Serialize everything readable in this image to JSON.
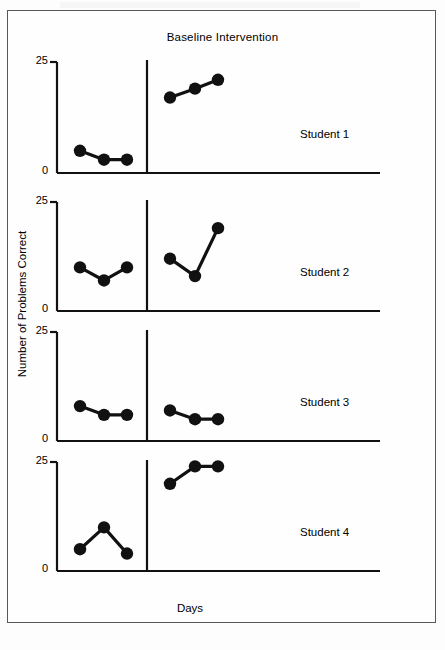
{
  "figure": {
    "phase_title": "Baseline Intervention",
    "x_axis_label": "Days",
    "y_axis_label": "Number of Problems Correct"
  },
  "chart_data": {
    "type": "line",
    "title": "Baseline Intervention",
    "xlabel": "Days",
    "ylabel": "Number of Problems Correct",
    "ylim": [
      0,
      25
    ],
    "yticks": [
      0,
      25
    ],
    "ytick_labels": [
      "0",
      "25"
    ],
    "grid": false,
    "legend": "none",
    "layout": "multiple-baseline across subjects, 4 stacked panels",
    "phases": [
      "Baseline",
      "Intervention"
    ],
    "panels": [
      {
        "name": "Student 1",
        "label": "Student 1",
        "tick_top": "25",
        "tick_bottom": "0",
        "series": [
          {
            "name": "Baseline",
            "x": [
              1,
              2,
              3
            ],
            "values": [
              5,
              3,
              3
            ]
          },
          {
            "name": "Intervention",
            "x": [
              5,
              6,
              7
            ],
            "values": [
              17,
              19,
              21
            ]
          }
        ]
      },
      {
        "name": "Student 2",
        "label": "Student 2",
        "tick_top": "25",
        "tick_bottom": "0",
        "series": [
          {
            "name": "Baseline",
            "x": [
              1,
              2,
              3
            ],
            "values": [
              10,
              7,
              10
            ]
          },
          {
            "name": "Intervention",
            "x": [
              5,
              6,
              7
            ],
            "values": [
              12,
              8,
              19
            ]
          }
        ]
      },
      {
        "name": "Student 3",
        "label": "Student 3",
        "tick_top": "25",
        "tick_bottom": "0",
        "series": [
          {
            "name": "Baseline",
            "x": [
              1,
              2,
              3
            ],
            "values": [
              8,
              6,
              6
            ]
          },
          {
            "name": "Intervention",
            "x": [
              5,
              6,
              7
            ],
            "values": [
              7,
              5,
              5
            ]
          }
        ]
      },
      {
        "name": "Student 4",
        "label": "Student 4",
        "tick_top": "25",
        "tick_bottom": "0",
        "series": [
          {
            "name": "Baseline",
            "x": [
              1,
              2,
              3
            ],
            "values": [
              5,
              10,
              4
            ]
          },
          {
            "name": "Intervention",
            "x": [
              5,
              6,
              7
            ],
            "values": [
              20,
              24,
              24
            ]
          }
        ]
      }
    ]
  }
}
